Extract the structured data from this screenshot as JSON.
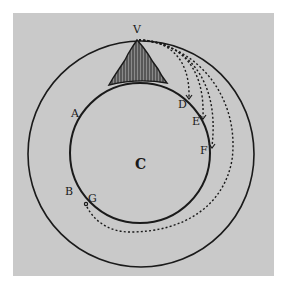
{
  "figure": {
    "colors": {
      "paper": "#c9c9c9",
      "ink": "#1a1a1a",
      "border": "#ffffff"
    },
    "labels": {
      "V": "V",
      "A": "A",
      "B": "B",
      "C": "C",
      "D": "D",
      "E": "E",
      "F": "F",
      "G": "G"
    },
    "elements": {
      "earth": "inner circle (Earth)",
      "orbit": "outer circle",
      "mountain": "hatched mountain at V",
      "trajectories": [
        "V to D",
        "V to E",
        "V to F",
        "V to G (around Earth)"
      ]
    }
  }
}
